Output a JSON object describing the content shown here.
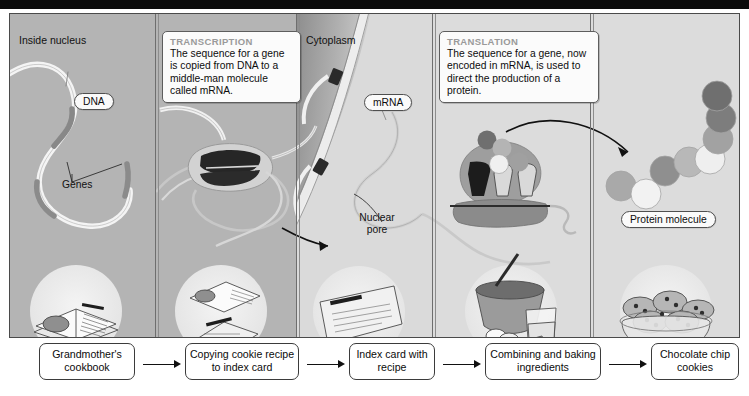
{
  "figure": {
    "regions": [
      {
        "name": "inside-nucleus",
        "label": "Inside nucleus"
      },
      {
        "name": "cytoplasm",
        "label": "Cytoplasm"
      }
    ],
    "callouts": [
      {
        "name": "transcription",
        "title": "TRANSCRIPTION",
        "body": "The sequence for a gene is copied from DNA to a middle-man molecule called mRNA."
      },
      {
        "name": "translation",
        "title": "TRANSLATION",
        "body": "The sequence for a gene, now encoded in mRNA, is used to direct the production of a protein."
      }
    ],
    "labels": {
      "dna": "DNA",
      "genes": "Genes",
      "mrna": "mRNA",
      "nuclear_pore": "Nuclear pore",
      "protein_molecule": "Protein molecule"
    },
    "flow_steps": [
      {
        "name": "grandmothers-cookbook",
        "label": "Grandmother's cookbook"
      },
      {
        "name": "copying-recipe",
        "label": "Copying cookie recipe to index card"
      },
      {
        "name": "index-card",
        "label": "Index card with recipe"
      },
      {
        "name": "combining-baking",
        "label": "Combining and baking ingredients"
      },
      {
        "name": "chocolate-chip-cookies",
        "label": "Chocolate chip cookies"
      }
    ],
    "colors": {
      "nucleus_background": "#b4b4b4",
      "cytoplasm_background": "#dcdcdc",
      "frame_border": "#4a4a4a",
      "top_bar": "#0b0b0b",
      "callout_title": "#9a9a9a",
      "dna_strand": "#f2f2f2",
      "gene_segment": "#8a8a8a",
      "polymerase": "#2b2b2b",
      "ribosome": "#9b9b9b",
      "protein_bead_dark": "#7c7c7c",
      "protein_bead_light": "#f0f0f0"
    },
    "protein_chain": {
      "bead_count": 8,
      "shades": [
        "#a9a9a9",
        "#f2f2f2",
        "#8f8f8f",
        "#b8b8b8",
        "#efefef",
        "#a2a2a2",
        "#7d7d7d",
        "#6f6f6f"
      ]
    }
  }
}
